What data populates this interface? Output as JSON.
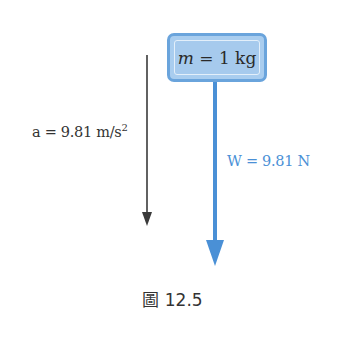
{
  "figure": {
    "mass_box": {
      "variable": "m",
      "equals": " = ",
      "value": "1 kg"
    },
    "acceleration": {
      "label": "a = 9.81 m/s",
      "exponent": "2"
    },
    "weight": {
      "label": "W = 9.81 N"
    },
    "caption": "圖 12.5"
  },
  "colors": {
    "accel_arrow": "#3a3a3a",
    "weight_arrow": "#4a90d6",
    "box_fill": "#a9cdef",
    "box_border": "#6aa4dc",
    "weight_text": "#4a90d6"
  }
}
